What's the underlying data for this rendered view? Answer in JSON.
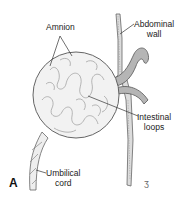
{
  "figure": {
    "panel_letter": "A",
    "labels": {
      "amnion": "Amnion",
      "abdominal_wall_line1": "Abdominal",
      "abdominal_wall_line2": "wall",
      "intestinal_loops_line1": "Intestinal",
      "intestinal_loops_line2": "loops",
      "umbilical_cord_line1": "Umbilical",
      "umbilical_cord_line2": "cord"
    },
    "signature": "ʒ",
    "colors": {
      "outline": "#555555",
      "sac_fill": "#f2f2f2",
      "bowel_fill": "#b5b5b5",
      "wall_fill": "#dcdcdc",
      "text": "#222222"
    }
  }
}
